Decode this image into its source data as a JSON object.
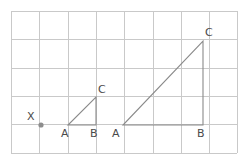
{
  "figure": {
    "canvas": {
      "width": 239,
      "height": 161,
      "background": "#ffffff"
    },
    "grid": {
      "line_color": "#c9c9c9",
      "x_start": 11,
      "y_start": 11,
      "cell_size": 28.3,
      "columns": 8,
      "rows": 5,
      "visible": true
    },
    "colors": {
      "grid": "#c9c9c9",
      "triangle_stroke": "#8a8a8a",
      "label_text": "#4a4a4a",
      "point_dot": "#8d8d8d"
    },
    "points": [
      {
        "id": "x-point",
        "label": "X",
        "x": 41,
        "y": 125,
        "label_x": 27,
        "label_y": 120,
        "marker": "dot"
      }
    ],
    "triangles": [
      {
        "id": "small-triangle",
        "name": "small right triangle",
        "vertices": [
          {
            "label": "A",
            "x": 68,
            "y": 125,
            "label_x": 61,
            "label_y": 137
          },
          {
            "label": "B",
            "x": 96,
            "y": 125,
            "label_x": 90,
            "label_y": 137
          },
          {
            "label": "C",
            "x": 96,
            "y": 97,
            "label_x": 98,
            "label_y": 93
          }
        ]
      },
      {
        "id": "large-triangle",
        "name": "large right triangle",
        "vertices": [
          {
            "label": "A",
            "x": 123,
            "y": 125,
            "label_x": 112,
            "label_y": 137
          },
          {
            "label": "B",
            "x": 203,
            "y": 125,
            "label_x": 197,
            "label_y": 137
          },
          {
            "label": "C",
            "x": 203,
            "y": 41,
            "label_x": 205,
            "label_y": 36
          }
        ]
      }
    ]
  }
}
